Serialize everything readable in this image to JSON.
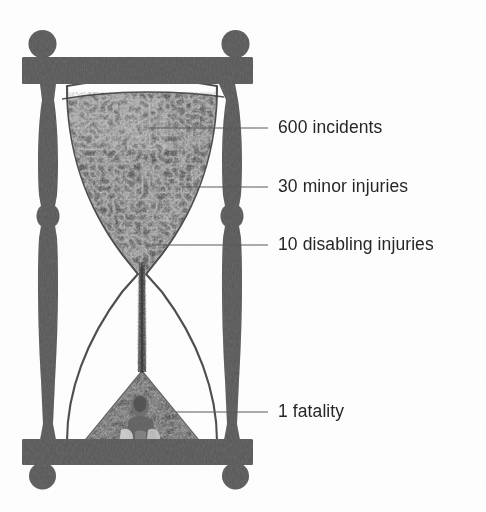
{
  "figure": {
    "type": "hourglass-infographic",
    "alt_name": "accident-pyramid-hourglass",
    "background_color": "#fdfdfd",
    "ink_color": "#4a4a4a",
    "text_color": "#262626",
    "frame": {
      "material_tone": "#555555",
      "top_finial_left": "ball-finial",
      "top_finial_right": "ball-finial",
      "bottom_foot_left": "ball-foot",
      "bottom_foot_right": "ball-foot",
      "column_left": "turned-baluster-column",
      "column_right": "turned-baluster-column",
      "top_rail": "top-cross-rail",
      "bottom_rail": "bottom-cross-rail"
    },
    "upper_bulb": {
      "name": "upper-bulb",
      "fill": "sand-granular-dark",
      "fill_level_label": "nearly full"
    },
    "neck": {
      "name": "hourglass-neck",
      "stream": "falling-sand-stream"
    },
    "lower_bulb": {
      "name": "lower-bulb",
      "fill": "sand-cone-pile",
      "contains": "human-figure-silhouette"
    }
  },
  "callouts": [
    {
      "id": "incidents",
      "text": "600 incidents",
      "y": 128,
      "leader_from_x": 148,
      "leader_to_x": 268
    },
    {
      "id": "minor-injuries",
      "text": "30 minor injuries",
      "y": 187,
      "leader_from_x": 182,
      "leader_to_x": 268
    },
    {
      "id": "disabling-injuries",
      "text": "10 disabling injuries",
      "y": 245,
      "leader_from_x": 152,
      "leader_to_x": 268
    },
    {
      "id": "fatality",
      "text": "1 fatality",
      "y": 412,
      "leader_from_x": 176,
      "leader_to_x": 268
    }
  ],
  "chart_data": {
    "type": "bar",
    "subtitle": "",
    "xlabel": "",
    "ylabel": "",
    "categories": [
      "600 incidents",
      "30 minor injuries",
      "10 disabling injuries",
      "1 fatality"
    ],
    "values": [
      600,
      30,
      10,
      1
    ],
    "labels": [
      "600 incidents",
      "30 minor injuries",
      "10 disabling injuries",
      "1 fatality"
    ],
    "legend": [],
    "grid": false,
    "ylim": [
      0,
      600
    ]
  }
}
